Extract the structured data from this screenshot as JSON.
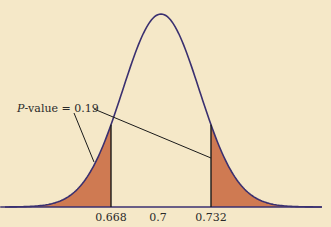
{
  "chart_data": {
    "type": "area",
    "title": "",
    "xlabel": "",
    "ylabel": "",
    "distribution": {
      "kind": "normal",
      "mean": 0.7,
      "sd": 0.0245
    },
    "tick_labels": [
      "0.668",
      "0.7",
      "0.732"
    ],
    "ticks": [
      0.668,
      0.7,
      0.732
    ],
    "shaded_regions": [
      {
        "name": "left-tail",
        "from": null,
        "to": 0.668
      },
      {
        "name": "right-tail",
        "from": 0.732,
        "to": null
      }
    ],
    "annotation": {
      "text": "P-value = 0.19",
      "prefix_italic": "P",
      "suffix": "-value = 0.19",
      "value": 0.19
    },
    "grid": false,
    "colors": {
      "background": "#f5e8c8",
      "curve": "#3a3070",
      "shade": "#cf7a52",
      "line": "#1a1a1a"
    }
  }
}
